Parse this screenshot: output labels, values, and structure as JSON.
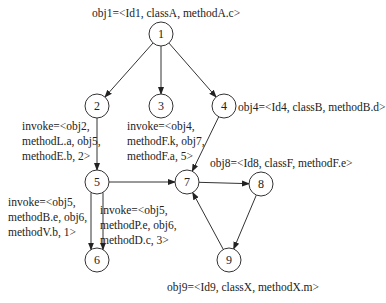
{
  "nodes": [
    {
      "id": "1",
      "label": "1",
      "x": 161,
      "y": 34
    },
    {
      "id": "2",
      "label": "2",
      "x": 97,
      "y": 106
    },
    {
      "id": "3",
      "label": "3",
      "x": 161,
      "y": 106
    },
    {
      "id": "4",
      "label": "4",
      "x": 224,
      "y": 106
    },
    {
      "id": "5",
      "label": "5",
      "x": 97,
      "y": 182
    },
    {
      "id": "6",
      "label": "6",
      "x": 97,
      "y": 260
    },
    {
      "id": "7",
      "label": "7",
      "x": 187,
      "y": 182
    },
    {
      "id": "8",
      "label": "8",
      "x": 261,
      "y": 184
    },
    {
      "id": "9",
      "label": "9",
      "x": 229,
      "y": 260
    }
  ],
  "edges": [
    {
      "from": "1",
      "to": "2"
    },
    {
      "from": "1",
      "to": "3"
    },
    {
      "from": "1",
      "to": "4"
    },
    {
      "from": "2",
      "to": "5"
    },
    {
      "from": "4",
      "to": "7"
    },
    {
      "from": "5",
      "to": "7"
    },
    {
      "from": "5",
      "to": "6",
      "variant": "left"
    },
    {
      "from": "5",
      "to": "6",
      "variant": "right"
    },
    {
      "from": "7",
      "to": "8"
    },
    {
      "from": "8",
      "to": "9"
    },
    {
      "from": "9",
      "to": "7"
    }
  ],
  "annotations": {
    "obj1": "obj1=<Id1, classA, methodA.c>",
    "obj4": "obj4=<Id4, classB, methodB.d>",
    "obj8": "obj8=<Id8, classF, methodF.e>",
    "obj9": "obj9=<Id9, classX, methodX.m>",
    "invoke_2_5": [
      "invoke=<obj2,",
      "methodL.a, obj5,",
      "methodE.b, 2>"
    ],
    "invoke_4_7": [
      "invoke=<obj4,",
      "methodF.k, obj7,",
      "methodF.a, 5>"
    ],
    "invoke_5_6a": [
      "invoke=<obj5,",
      "methodB.e, obj6,",
      "methodV.b, 1>"
    ],
    "invoke_5_6b": [
      "invoke=<obj5,",
      "methodP.e, obj6,",
      "methodD.c, 3>"
    ]
  }
}
